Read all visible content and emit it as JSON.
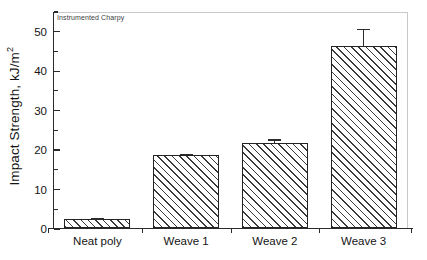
{
  "chart_data": {
    "type": "bar",
    "title": "",
    "annotation": "Instrumented Charpy",
    "xlabel": "",
    "ylabel": "Impact Strength, kJ/m",
    "ylabel_exponent": "2",
    "categories": [
      "Neat poly",
      "Weave 1",
      "Weave 2",
      "Weave 3"
    ],
    "values": [
      2.2,
      18.4,
      21.5,
      46.2
    ],
    "errors": [
      0.5,
      0.7,
      1.2,
      4.5
    ],
    "ylim": [
      0,
      55
    ],
    "yticks": [
      0,
      10,
      20,
      30,
      40,
      50
    ],
    "ytick_labels": [
      "0",
      "10",
      "20",
      "30",
      "40",
      "50"
    ],
    "yticks_minor": [
      5,
      15,
      25,
      35,
      45,
      55
    ],
    "grid": false,
    "legend": false,
    "bar_fill": "hatched-diagonal",
    "bar_edge_color": "#232323",
    "axis_color": "#2b2b2b",
    "frame_color": "#c9c9c9",
    "background": "#ffffff"
  }
}
